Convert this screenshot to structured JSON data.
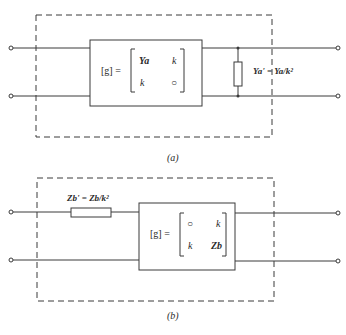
{
  "figure_a": {
    "caption": "(a)",
    "matrix_lhs": "[g] =",
    "matrix": {
      "r1c1": "Ya",
      "r1c2": "k",
      "r2c1": "k",
      "r2c2": "○"
    },
    "shunt_label": "Ya' = Ya/k²"
  },
  "figure_b": {
    "caption": "(b)",
    "matrix_lhs": "[g] =",
    "matrix": {
      "r1c1": "○",
      "r1c2": "k",
      "r2c1": "k",
      "r2c2": "Zb"
    },
    "series_label": "Zb' = Zb/k²"
  },
  "colors": {
    "line": "#3a3a3a",
    "background": "#ffffff"
  }
}
